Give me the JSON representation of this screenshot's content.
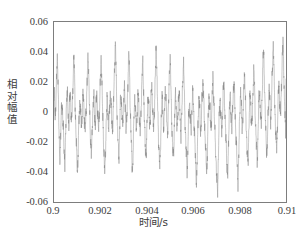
{
  "chart_data": {
    "type": "line",
    "title": "",
    "xlabel": "时间/s",
    "ylabel": "相对幅值",
    "xlabel_text": "时间/s",
    "ylabel_chars": [
      "相",
      "对",
      "幅",
      "值"
    ],
    "xlim": [
      0.9,
      0.91
    ],
    "ylim": [
      -0.06,
      0.06
    ],
    "xticks": [
      0.9,
      0.902,
      0.904,
      0.906,
      0.908,
      0.91
    ],
    "xtick_labels": [
      "0.9",
      "0.902",
      "0.904",
      "0.906",
      "0.908",
      "0.91"
    ],
    "yticks": [
      0.06,
      0.04,
      0.02,
      0,
      -0.02,
      -0.04,
      -0.06
    ],
    "ytick_labels": [
      "0.06",
      "0.04",
      "0.02",
      "0",
      "-0.02",
      "-0.04",
      "-0.06"
    ],
    "grid": false,
    "legend": null,
    "line_color": "#808080",
    "line_width": 0.5,
    "background_color": "#ffffff",
    "axis_color": "#7d7d7d",
    "series": [
      {
        "name": "振动信号",
        "n_points": 601,
        "x_start": 0.9,
        "x_end": 0.91,
        "description": "宽带调制振动波形，峰峰值约 0.1，含多个高频分量与拍频包络",
        "y_min": -0.053,
        "y_max": 0.046,
        "values": [
          0.004,
          0.01,
          0.002,
          -0.004,
          0.001,
          0.008,
          0.013,
          0.023,
          0.031,
          0.037,
          0.03,
          0.018,
          0.004,
          -0.01,
          -0.02,
          -0.027,
          -0.03,
          -0.024,
          -0.014,
          -0.005,
          0.003,
          0.007,
          0.004,
          -0.002,
          -0.008,
          -0.013,
          -0.018,
          -0.024,
          -0.03,
          -0.035,
          -0.028,
          -0.017,
          -0.006,
          0.004,
          0.01,
          0.013,
          0.009,
          0.003,
          -0.003,
          -0.008,
          -0.006,
          0.0,
          0.007,
          0.013,
          0.01,
          0.004,
          -0.002,
          -0.006,
          -0.003,
          0.004,
          0.012,
          0.021,
          0.03,
          0.037,
          0.032,
          0.022,
          0.011,
          0.0,
          -0.009,
          -0.017,
          -0.024,
          -0.03,
          -0.036,
          -0.039,
          -0.033,
          -0.022,
          -0.012,
          -0.003,
          0.003,
          0.007,
          0.005,
          0.0,
          -0.005,
          -0.009,
          -0.007,
          -0.002,
          0.004,
          0.009,
          0.012,
          0.008,
          0.002,
          -0.004,
          -0.009,
          -0.013,
          -0.01,
          -0.004,
          0.002,
          0.008,
          0.015,
          0.023,
          0.031,
          0.038,
          0.033,
          0.023,
          0.012,
          0.002,
          -0.007,
          -0.014,
          -0.019,
          -0.024,
          -0.027,
          -0.022,
          -0.013,
          -0.004,
          0.003,
          0.008,
          0.01,
          0.006,
          0.0,
          -0.005,
          -0.009,
          -0.006,
          0.001,
          0.007,
          0.013,
          0.01,
          0.004,
          -0.002,
          -0.007,
          -0.011,
          -0.008,
          -0.001,
          0.006,
          0.014,
          0.022,
          0.03,
          0.037,
          0.031,
          0.021,
          0.01,
          0.0,
          -0.009,
          -0.017,
          -0.024,
          -0.03,
          -0.037,
          -0.041,
          -0.034,
          -0.023,
          -0.012,
          -0.003,
          0.004,
          0.008,
          0.005,
          -0.001,
          -0.006,
          -0.01,
          -0.007,
          -0.001,
          0.006,
          0.011,
          0.014,
          0.009,
          0.003,
          -0.003,
          -0.008,
          -0.012,
          -0.009,
          -0.002,
          0.005,
          0.013,
          0.022,
          0.031,
          0.04,
          0.045,
          0.038,
          0.026,
          0.014,
          0.003,
          -0.006,
          -0.013,
          -0.019,
          -0.025,
          -0.03,
          -0.026,
          -0.016,
          -0.006,
          0.002,
          0.008,
          0.011,
          0.008,
          0.002,
          -0.004,
          -0.009,
          -0.007,
          0.0,
          0.007,
          0.013,
          0.016,
          0.011,
          0.004,
          -0.002,
          -0.008,
          -0.012,
          -0.009,
          -0.002,
          0.006,
          0.015,
          0.024,
          0.033,
          0.041,
          0.035,
          0.024,
          0.012,
          0.001,
          -0.008,
          -0.016,
          -0.023,
          -0.029,
          -0.035,
          -0.039,
          -0.032,
          -0.021,
          -0.01,
          -0.001,
          0.005,
          0.008,
          0.004,
          -0.002,
          -0.007,
          -0.011,
          -0.008,
          -0.002,
          0.005,
          0.011,
          0.014,
          0.009,
          0.002,
          -0.004,
          -0.009,
          -0.013,
          -0.01,
          -0.003,
          0.005,
          0.013,
          0.021,
          0.028,
          0.033,
          0.028,
          0.018,
          0.008,
          -0.001,
          -0.009,
          -0.016,
          -0.021,
          -0.026,
          -0.03,
          -0.025,
          -0.015,
          -0.005,
          0.003,
          0.008,
          0.01,
          0.006,
          0.0,
          -0.005,
          -0.009,
          -0.006,
          0.001,
          0.008,
          0.014,
          0.018,
          0.013,
          0.006,
          -0.001,
          -0.007,
          -0.011,
          -0.008,
          -0.001,
          0.008,
          0.017,
          0.026,
          0.035,
          0.043,
          0.037,
          0.026,
          0.014,
          0.003,
          -0.006,
          -0.014,
          -0.021,
          -0.027,
          -0.032,
          -0.036,
          -0.03,
          -0.019,
          -0.009,
          0.0,
          0.006,
          0.009,
          0.006,
          0.0,
          -0.006,
          -0.01,
          -0.008,
          -0.001,
          0.006,
          0.012,
          0.015,
          0.01,
          0.003,
          -0.003,
          -0.009,
          -0.013,
          -0.011,
          -0.004,
          0.004,
          0.013,
          0.022,
          0.031,
          0.038,
          0.032,
          0.021,
          0.01,
          0.0,
          -0.009,
          -0.016,
          -0.022,
          -0.027,
          -0.031,
          -0.026,
          -0.016,
          -0.006,
          0.002,
          0.008,
          0.01,
          0.007,
          0.001,
          -0.005,
          -0.01,
          -0.008,
          -0.002,
          0.005,
          0.011,
          0.015,
          0.01,
          0.003,
          -0.003,
          -0.009,
          -0.014,
          -0.012,
          -0.005,
          0.003,
          0.012,
          0.02,
          0.027,
          0.032,
          0.026,
          0.016,
          0.005,
          -0.004,
          -0.012,
          -0.019,
          -0.025,
          -0.031,
          -0.036,
          -0.039,
          -0.033,
          -0.022,
          -0.012,
          -0.003,
          0.003,
          0.006,
          0.003,
          -0.003,
          -0.008,
          -0.012,
          -0.009,
          -0.003,
          0.004,
          0.01,
          0.013,
          0.008,
          0.002,
          -0.005,
          -0.011,
          -0.017,
          -0.024,
          -0.031,
          -0.038,
          -0.044,
          -0.047,
          -0.04,
          -0.028,
          -0.016,
          -0.005,
          0.003,
          0.008,
          0.009,
          0.004,
          -0.002,
          -0.008,
          -0.013,
          -0.011,
          -0.004,
          0.004,
          0.011,
          0.017,
          0.021,
          0.016,
          0.008,
          0.001,
          -0.006,
          -0.012,
          -0.017,
          -0.023,
          -0.029,
          -0.035,
          -0.04,
          -0.036,
          -0.025,
          -0.014,
          -0.004,
          0.004,
          0.009,
          0.011,
          0.006,
          0.0,
          -0.006,
          -0.011,
          -0.01,
          -0.003,
          0.005,
          0.013,
          0.019,
          0.022,
          0.017,
          0.009,
          0.001,
          -0.007,
          -0.014,
          -0.02,
          -0.026,
          -0.032,
          -0.038,
          -0.044,
          -0.048,
          -0.053,
          -0.046,
          -0.033,
          -0.02,
          -0.009,
          0.0,
          0.006,
          0.008,
          0.004,
          -0.002,
          -0.008,
          -0.013,
          -0.011,
          -0.004,
          0.004,
          0.011,
          0.016,
          0.019,
          0.014,
          0.006,
          -0.002,
          -0.009,
          -0.015,
          -0.021,
          -0.027,
          -0.033,
          -0.039,
          -0.044,
          -0.038,
          -0.026,
          -0.014,
          -0.004,
          0.004,
          0.009,
          0.01,
          0.005,
          -0.001,
          -0.007,
          -0.012,
          -0.01,
          -0.003,
          0.005,
          0.012,
          0.017,
          0.02,
          0.015,
          0.007,
          -0.001,
          -0.008,
          -0.014,
          -0.02,
          -0.026,
          -0.032,
          -0.038,
          -0.044,
          -0.046,
          -0.039,
          -0.027,
          -0.015,
          -0.004,
          0.004,
          0.01,
          0.012,
          0.008,
          0.001,
          -0.005,
          -0.011,
          -0.01,
          -0.003,
          0.006,
          0.014,
          0.021,
          0.026,
          0.021,
          0.012,
          0.003,
          -0.005,
          -0.012,
          -0.018,
          -0.024,
          -0.029,
          -0.034,
          -0.03,
          -0.019,
          -0.008,
          0.001,
          0.008,
          0.012,
          0.009,
          0.003,
          -0.003,
          -0.009,
          -0.008,
          -0.001,
          0.007,
          0.015,
          0.022,
          0.028,
          0.024,
          0.015,
          0.005,
          -0.003,
          -0.01,
          -0.016,
          -0.022,
          -0.027,
          -0.032,
          -0.027,
          -0.017,
          -0.006,
          0.003,
          0.01,
          0.014,
          0.011,
          0.004,
          -0.002,
          -0.008,
          -0.007,
          0.001,
          0.01,
          0.019,
          0.028,
          0.036,
          0.042,
          0.035,
          0.024,
          0.013,
          0.003,
          -0.005,
          -0.012,
          -0.018,
          -0.023,
          -0.028,
          -0.023,
          -0.013,
          -0.003,
          0.006,
          0.012,
          0.015,
          0.012,
          0.006,
          0.0,
          -0.005,
          -0.004,
          0.004,
          0.013,
          0.022,
          0.031,
          0.039,
          0.044,
          0.037,
          0.026,
          0.015,
          0.005,
          -0.003,
          -0.01,
          -0.016,
          -0.021,
          -0.025,
          -0.02,
          -0.01,
          0.0,
          0.008,
          0.015,
          0.018,
          0.015,
          0.009,
          0.003,
          -0.002,
          -0.001,
          0.008,
          0.017,
          0.026,
          0.035,
          0.042,
          0.046,
          0.039,
          0.028,
          0.017,
          0.007,
          -0.001,
          -0.008,
          -0.014,
          0.022
        ]
      }
    ]
  }
}
